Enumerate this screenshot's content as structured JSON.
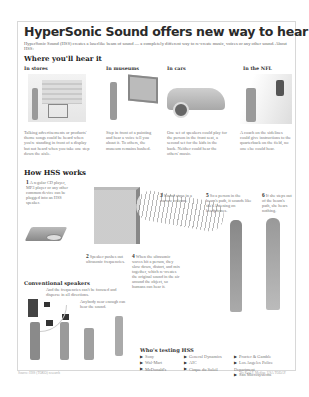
{
  "title": "HyperSonic Sound offers new way to hear",
  "intro": "HyperSonic Sound (HSS) creates a laserlike beam of sound — a completely different way to re-create music, voices or any other sound. About HSS:",
  "where": {
    "heading": "Where you'll hear it",
    "sections": [
      {
        "label": "In stores",
        "caption": "Talking advertisements or products' theme songs could be heard when you're standing in front of a display but not heard when you take one step down the aisle."
      },
      {
        "label": "In museums",
        "caption": "Step in front of a painting and hear a voice tell you about it. To others, the museum remains hushed."
      },
      {
        "label": "In cars",
        "caption": "One set of speakers could play for the person in the front seat, a second set for the kids in the back. Neither could hear the others' music."
      },
      {
        "label": "In the NFL",
        "caption": "A coach on the sidelines could give instructions to the quarterback on the field, no one else could hear."
      }
    ]
  },
  "how": {
    "heading": "How HSS works",
    "steps": [
      {
        "num": "1",
        "text": "A regular CD player, MP3 player or any other common device can be plugged into an HSS speaker."
      },
      {
        "num": "2",
        "text": "Speaker pushes out ultrasonic frequencies."
      },
      {
        "num": "3",
        "text": "Sound stays in a narrow column."
      },
      {
        "num": "4",
        "text": "When the ultrasonic waves hit a person, they slow down, distort, and mix together, which re-creates the original sound in the air around the object, so humans can hear it."
      },
      {
        "num": "5",
        "text": "So a person in the beam's path, it sounds like she's listening on headphones."
      },
      {
        "num": "6",
        "text": "If she steps out of the beam's path, she hears nothing."
      }
    ]
  },
  "conventional": {
    "heading": "Conventional speakers",
    "text1": "And the frequencies can't be focused and disperse in all directions.",
    "text2": "Anybody near enough can hear the sound."
  },
  "testing": {
    "heading": "Who's testing HSS",
    "col1": [
      "Sony",
      "Wal-Mart",
      "McDonald's"
    ],
    "col2": [
      "General Dynamics",
      "AIC",
      "Cirque du Soleil"
    ],
    "col3": [
      "Procter & Gamble",
      "Los Angeles Police Department",
      "San Microsystems"
    ]
  },
  "footer": {
    "source": "Source: HSS (TOKO) research",
    "credit": "By Karl F. Medina, USA TODAY"
  }
}
